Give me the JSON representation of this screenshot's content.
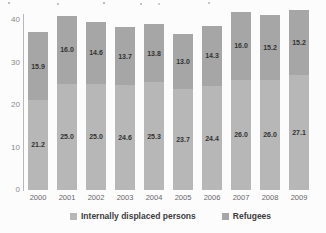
{
  "chart_data": {
    "type": "bar",
    "stacked": true,
    "categories": [
      "2000",
      "2001",
      "2002",
      "2003",
      "2004",
      "2005",
      "2006",
      "2007",
      "2008",
      "2009"
    ],
    "series": [
      {
        "name": "Internally displaced persons",
        "color": "#b7b7b7",
        "values": [
          21.2,
          25.0,
          25.0,
          24.6,
          25.3,
          23.7,
          24.4,
          26.0,
          26.0,
          27.1
        ]
      },
      {
        "name": "Refugees",
        "color": "#a6a6a6",
        "values": [
          15.9,
          16.0,
          14.6,
          13.7,
          13.8,
          13.0,
          14.3,
          16.0,
          15.2,
          15.2
        ]
      }
    ],
    "value_labels_decimals": 1,
    "ylim": [
      0,
      40
    ],
    "yticks": [
      0,
      10,
      20,
      30,
      40
    ],
    "xlabel": "",
    "ylabel": "",
    "grid": false,
    "legend_position": "bottom"
  },
  "colors": {
    "background": "#fcfcfc",
    "axis": "#b8b8b8",
    "tick_text": "#8a8a8a",
    "year_text": "#666666",
    "value_text": "#333333",
    "legend_text": "#3d3d3d"
  }
}
